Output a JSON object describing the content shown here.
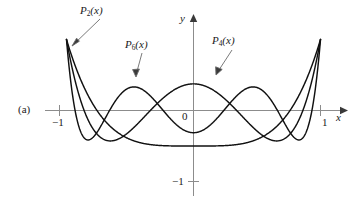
{
  "figure": {
    "panel_label": "(a)",
    "axis_labels": {
      "x": "x",
      "y": "y"
    },
    "origin_label": "0",
    "tick_labels": {
      "x_neg1": "−1",
      "x_pos1": "1",
      "y_neg1": "−1"
    },
    "curve_labels": {
      "p2": "P₂(x)",
      "p6": "P₆(x)",
      "p4": "P₄(x)"
    },
    "colors": {
      "curve": "#111111",
      "axis": "#8c8c8c",
      "text": "#1a1a1a",
      "background": "#ffffff"
    }
  },
  "chart_data": {
    "type": "line",
    "title": "",
    "xlabel": "x",
    "ylabel": "y",
    "xlim": [
      -1,
      1
    ],
    "ylim": [
      -1.05,
      1.05
    ],
    "grid": false,
    "legend": "inline-annotations",
    "xticks": [
      -1,
      0,
      1
    ],
    "xticklabels": [
      "−1",
      "0",
      "1"
    ],
    "yticks": [
      -1
    ],
    "yticklabels": [
      "−1"
    ],
    "annotations": [
      {
        "text": "P₂(x)",
        "points_to_series": "P2(x)",
        "tip_x": -0.93,
        "tip_y": 0.53
      },
      {
        "text": "P₆(x)",
        "points_to_series": "P6(x)",
        "tip_x": -0.43,
        "tip_y": 0.33
      },
      {
        "text": "P₄(x)",
        "points_to_series": "P4(x)",
        "tip_x": 0.17,
        "tip_y": 0.35
      }
    ],
    "series": [
      {
        "name": "P2(x)",
        "formula": "(3x^2 - 1)/2",
        "coeffs_even_desc": [
          1.5,
          0,
          -0.5
        ],
        "x": [
          -1.0,
          -0.9,
          -0.8,
          -0.7,
          -0.6,
          -0.5,
          -0.4,
          -0.3,
          -0.2,
          -0.1,
          0.0,
          0.1,
          0.2,
          0.3,
          0.4,
          0.5,
          0.6,
          0.7,
          0.8,
          0.9,
          1.0
        ],
        "values": [
          1.0,
          0.715,
          0.46,
          0.235,
          0.04,
          -0.125,
          -0.26,
          -0.365,
          -0.44,
          -0.485,
          -0.5,
          -0.485,
          -0.44,
          -0.365,
          -0.26,
          -0.125,
          0.04,
          0.235,
          0.46,
          0.715,
          1.0
        ]
      },
      {
        "name": "P4(x)",
        "formula": "(35x^4 - 30x^2 + 3)/8",
        "coeffs_even_desc": [
          4.375,
          -3.75,
          0.375
        ],
        "x": [
          -1.0,
          -0.9,
          -0.8,
          -0.7,
          -0.6,
          -0.5,
          -0.4,
          -0.3,
          -0.2,
          -0.1,
          0.0,
          0.1,
          0.2,
          0.3,
          0.4,
          0.5,
          0.6,
          0.7,
          0.8,
          0.9,
          1.0
        ],
        "values": [
          1.0,
          0.2079,
          -0.2331,
          -0.4121,
          -0.4079,
          -0.2891,
          -0.113,
          0.0729,
          0.2323,
          0.3397,
          0.375,
          0.3397,
          0.2323,
          0.0729,
          -0.113,
          -0.2891,
          -0.4079,
          -0.4121,
          -0.2331,
          0.2079,
          1.0
        ]
      },
      {
        "name": "P6(x)",
        "formula": "(231x^6 - 315x^4 + 105x^2 - 5)/16",
        "coeffs_even_desc": [
          14.4375,
          -19.6875,
          6.5625,
          -0.3125
        ],
        "x": [
          -1.0,
          -0.9,
          -0.8,
          -0.7,
          -0.6,
          -0.5,
          -0.4,
          -0.3,
          -0.2,
          -0.1,
          0.0,
          0.1,
          0.2,
          0.3,
          0.4,
          0.5,
          0.6,
          0.7,
          0.8,
          0.9,
          1.0
        ],
        "values": [
          1.0,
          -0.2412,
          -0.3269,
          0.1253,
          0.3141,
          0.3232,
          0.1552,
          -0.0947,
          -0.2808,
          -0.3177,
          -0.3125,
          -0.3177,
          -0.2808,
          -0.0947,
          0.1552,
          0.3232,
          0.3141,
          0.1253,
          -0.3269,
          -0.2412,
          1.0
        ]
      }
    ]
  }
}
